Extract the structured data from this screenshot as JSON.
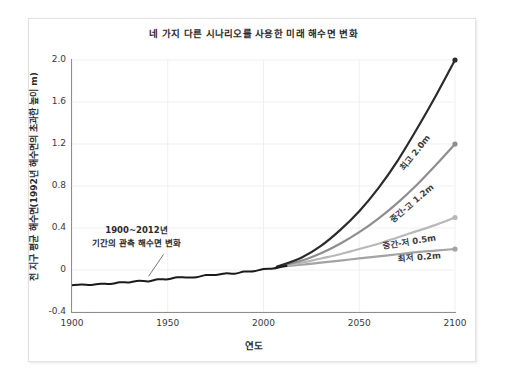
{
  "chart_data": {
    "type": "line",
    "title": "네 가지 다른 시나리오를 사용한 미래 해수면 변화",
    "xlabel": "연도",
    "ylabel": "전 지구 평균 해수면(1992년 해수면의 초과한 높이 m)",
    "xlim": [
      1900,
      2100
    ],
    "ylim": [
      -0.4,
      2.0
    ],
    "xticks": [
      "1900",
      "1950",
      "2000",
      "2050",
      "2100"
    ],
    "xtick_values": [
      1900,
      1950,
      2000,
      2050,
      2100
    ],
    "yticks": [
      "2.0",
      "1.6",
      "1.2",
      "0.8",
      "0.4",
      "0",
      "-0.4"
    ],
    "ytick_values": [
      2.0,
      1.6,
      1.2,
      0.8,
      0.4,
      0,
      -0.4
    ],
    "grid": true,
    "legend_position": "inline-right",
    "annotations": [
      {
        "name": "observed-annotation",
        "line1": "1900~2012년",
        "line2": "기간의 관측 해수면 변화",
        "points_to_x": 1940,
        "points_to_y": -0.06
      }
    ],
    "series": [
      {
        "name": "관측 해수면 변화",
        "label": "",
        "color": "#1a1a1a",
        "width": 2.0,
        "x": [
          1900,
          1905,
          1910,
          1915,
          1920,
          1925,
          1930,
          1935,
          1940,
          1945,
          1950,
          1955,
          1960,
          1965,
          1970,
          1975,
          1980,
          1985,
          1990,
          1995,
          2000,
          2005,
          2010,
          2012
        ],
        "values": [
          -0.145,
          -0.142,
          -0.138,
          -0.133,
          -0.128,
          -0.122,
          -0.115,
          -0.108,
          -0.1,
          -0.092,
          -0.084,
          -0.076,
          -0.068,
          -0.061,
          -0.053,
          -0.045,
          -0.036,
          -0.028,
          -0.018,
          -0.008,
          0.004,
          0.018,
          0.032,
          0.038
        ]
      },
      {
        "name": "최고",
        "label": "최고 2.0m",
        "end_value": 2.0,
        "color": "#2b2b2b",
        "width": 2.2,
        "x": [
          2007,
          2020,
          2030,
          2040,
          2050,
          2060,
          2070,
          2080,
          2090,
          2100
        ],
        "values": [
          0.03,
          0.12,
          0.23,
          0.38,
          0.56,
          0.78,
          1.04,
          1.34,
          1.66,
          2.0
        ]
      },
      {
        "name": "중간-고",
        "label": "중간-고 1.2m",
        "end_value": 1.2,
        "color": "#8e8e8e",
        "width": 2.2,
        "x": [
          2007,
          2020,
          2030,
          2040,
          2050,
          2060,
          2070,
          2080,
          2090,
          2100
        ],
        "values": [
          0.03,
          0.09,
          0.16,
          0.25,
          0.36,
          0.49,
          0.64,
          0.81,
          1.0,
          1.2
        ]
      },
      {
        "name": "중간-저",
        "label": "중간-저 0.5m",
        "end_value": 0.5,
        "color": "#b8b8b8",
        "width": 2.2,
        "x": [
          2007,
          2020,
          2030,
          2040,
          2050,
          2060,
          2070,
          2080,
          2090,
          2100
        ],
        "values": [
          0.03,
          0.07,
          0.11,
          0.15,
          0.2,
          0.25,
          0.31,
          0.37,
          0.43,
          0.5
        ]
      },
      {
        "name": "최저",
        "label": "최저 0.2m",
        "end_value": 0.2,
        "color": "#a3a3a3",
        "width": 2.2,
        "x": [
          2007,
          2020,
          2030,
          2040,
          2050,
          2060,
          2070,
          2080,
          2090,
          2100
        ],
        "values": [
          0.03,
          0.05,
          0.07,
          0.09,
          0.11,
          0.13,
          0.15,
          0.17,
          0.185,
          0.2
        ]
      }
    ]
  }
}
